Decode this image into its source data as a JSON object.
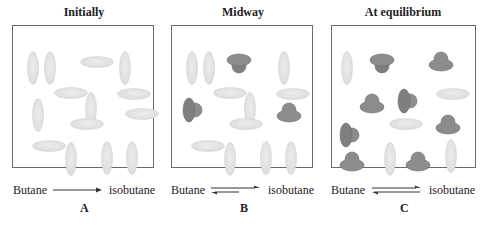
{
  "figure": {
    "panels": [
      {
        "id": "A",
        "title": "Initially",
        "reactant": "Butane",
        "product": "isobutane",
        "letter": "A",
        "arrow": "forward",
        "molecules": [
          {
            "type": "butane",
            "orient": "v",
            "x": 14,
            "y": 25
          },
          {
            "type": "butane",
            "orient": "v",
            "x": 31,
            "y": 25
          },
          {
            "type": "butane",
            "orient": "h",
            "x": 67,
            "y": 30
          },
          {
            "type": "butane",
            "orient": "v",
            "x": 106,
            "y": 25
          },
          {
            "type": "butane",
            "orient": "v",
            "x": 19,
            "y": 72
          },
          {
            "type": "butane",
            "orient": "h",
            "x": 41,
            "y": 61
          },
          {
            "type": "butane",
            "orient": "v",
            "x": 72,
            "y": 66
          },
          {
            "type": "butane",
            "orient": "h",
            "x": 104,
            "y": 62
          },
          {
            "type": "butane",
            "orient": "h",
            "x": 112,
            "y": 82
          },
          {
            "type": "butane",
            "orient": "h",
            "x": 57,
            "y": 92
          },
          {
            "type": "butane",
            "orient": "h",
            "x": 19,
            "y": 114
          },
          {
            "type": "butane",
            "orient": "v",
            "x": 52,
            "y": 116
          },
          {
            "type": "butane",
            "orient": "v",
            "x": 88,
            "y": 115
          },
          {
            "type": "butane",
            "orient": "v",
            "x": 113,
            "y": 115
          }
        ]
      },
      {
        "id": "B",
        "title": "Midway",
        "reactant": "Butane",
        "product": "isobutane",
        "letter": "B",
        "arrow": "forward-dominant",
        "molecules": [
          {
            "type": "butane",
            "orient": "v",
            "x": 14,
            "y": 25
          },
          {
            "type": "butane",
            "orient": "v",
            "x": 31,
            "y": 25
          },
          {
            "type": "isobutane",
            "orient": "down",
            "x": 54,
            "y": 27
          },
          {
            "type": "butane",
            "orient": "v",
            "x": 106,
            "y": 25
          },
          {
            "type": "isobutane",
            "orient": "right",
            "x": 9,
            "y": 71
          },
          {
            "type": "butane",
            "orient": "h",
            "x": 41,
            "y": 61
          },
          {
            "type": "butane",
            "orient": "v",
            "x": 72,
            "y": 66
          },
          {
            "type": "butane",
            "orient": "h",
            "x": 104,
            "y": 62
          },
          {
            "type": "isobutane",
            "orient": "up",
            "x": 104,
            "y": 75
          },
          {
            "type": "butane",
            "orient": "h",
            "x": 57,
            "y": 92
          },
          {
            "type": "butane",
            "orient": "h",
            "x": 19,
            "y": 114
          },
          {
            "type": "butane",
            "orient": "v",
            "x": 52,
            "y": 116
          },
          {
            "type": "butane",
            "orient": "v",
            "x": 88,
            "y": 115
          },
          {
            "type": "butane",
            "orient": "v",
            "x": 113,
            "y": 115
          }
        ]
      },
      {
        "id": "C",
        "title": "At equilibrium",
        "reactant": "Butane",
        "product": "isobutane",
        "letter": "C",
        "arrow": "equilibrium",
        "molecules": [
          {
            "type": "butane",
            "orient": "v",
            "x": 9,
            "y": 25
          },
          {
            "type": "isobutane",
            "orient": "down",
            "x": 37,
            "y": 27
          },
          {
            "type": "isobutane",
            "orient": "up",
            "x": 96,
            "y": 24
          },
          {
            "type": "isobutane",
            "orient": "up",
            "x": 27,
            "y": 66
          },
          {
            "type": "isobutane",
            "orient": "right",
            "x": 64,
            "y": 62
          },
          {
            "type": "butane",
            "orient": "h",
            "x": 104,
            "y": 62
          },
          {
            "type": "isobutane",
            "orient": "right",
            "x": 6,
            "y": 96
          },
          {
            "type": "butane",
            "orient": "h",
            "x": 57,
            "y": 92
          },
          {
            "type": "isobutane",
            "orient": "up",
            "x": 103,
            "y": 87
          },
          {
            "type": "isobutane",
            "orient": "up",
            "x": 7,
            "y": 124
          },
          {
            "type": "butane",
            "orient": "v",
            "x": 52,
            "y": 116
          },
          {
            "type": "isobutane",
            "orient": "up",
            "x": 73,
            "y": 124
          },
          {
            "type": "butane",
            "orient": "v",
            "x": 113,
            "y": 113
          }
        ]
      }
    ],
    "colors": {
      "butane_fill": "#dcdcdc",
      "butane_highlight": "#ececec",
      "isobutane_fill": "#8c8c8c",
      "isobutane_dark": "#6e6e6e",
      "border": "#6a6a6a",
      "text": "#222222"
    }
  }
}
